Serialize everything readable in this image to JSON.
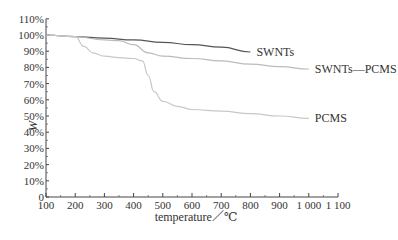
{
  "chart_data": {
    "type": "line",
    "title": "",
    "xlabel": "temperature／℃",
    "ylabel": "W",
    "xlim": [
      100,
      1100
    ],
    "ylim": [
      0,
      110
    ],
    "x_ticks": [
      "100",
      "200",
      "300",
      "400",
      "500",
      "600",
      "700",
      "800",
      "900",
      "1 000",
      "1 100"
    ],
    "y_ticks": [
      "0",
      "10%",
      "20%",
      "30%",
      "40%",
      "50%",
      "60%",
      "70%",
      "80%",
      "90%",
      "100%",
      "110%"
    ],
    "grid": false,
    "legend": "inline labels at line ends",
    "series": [
      {
        "name": "SWNTs",
        "color": "#555555",
        "x": [
          100,
          200,
          300,
          400,
          500,
          600,
          700,
          800
        ],
        "y": [
          100,
          99,
          98,
          97,
          95.5,
          94,
          92.5,
          89.5
        ]
      },
      {
        "name": "SWNTs—PCMS",
        "color": "#bbbbbb",
        "x": [
          100,
          200,
          300,
          350,
          400,
          450,
          500,
          600,
          700,
          800,
          900,
          1000
        ],
        "y": [
          100,
          99,
          97,
          96.5,
          94,
          89,
          87,
          85.5,
          84,
          82,
          80.5,
          79
        ]
      },
      {
        "name": "PCMS",
        "color": "#c8c8c8",
        "x": [
          100,
          200,
          230,
          260,
          300,
          350,
          400,
          430,
          450,
          470,
          500,
          550,
          600,
          700,
          800,
          900,
          1000
        ],
        "y": [
          100,
          99,
          93,
          89,
          87,
          86,
          85.5,
          84,
          75,
          65,
          59,
          56,
          54,
          53,
          51.5,
          50,
          48.5
        ]
      }
    ]
  }
}
